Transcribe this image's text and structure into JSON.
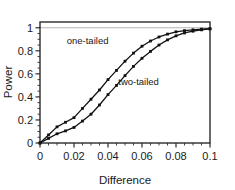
{
  "chart_data": {
    "type": "line",
    "title": "",
    "xlabel": "Difference",
    "ylabel": "Power",
    "xlim": [
      0,
      0.1
    ],
    "ylim": [
      0,
      1.05
    ],
    "grid": false,
    "legend_position": "inline-annotation",
    "reference_line": {
      "axis": "y",
      "value": 1,
      "color": "#b4b4b4"
    },
    "xticks": [
      0,
      0.02,
      0.04,
      0.06,
      0.08,
      0.1
    ],
    "xtick_labels": [
      "0",
      "0.02",
      "0.04",
      "0.06",
      "0.08",
      "0.1"
    ],
    "xminor_step": 0.005,
    "yticks": [
      0,
      0.2,
      0.4,
      0.6,
      0.8,
      1
    ],
    "ytick_labels": [
      "0",
      "0.2",
      "0.4",
      "0.6",
      "0.8",
      "1"
    ],
    "yminor_step": 0.05,
    "x": [
      0,
      0.005,
      0.01,
      0.015,
      0.02,
      0.025,
      0.03,
      0.035,
      0.04,
      0.045,
      0.05,
      0.055,
      0.06,
      0.065,
      0.07,
      0.075,
      0.08,
      0.085,
      0.09,
      0.095,
      0.1
    ],
    "series": [
      {
        "name": "one-tailed",
        "label": "one-tailed",
        "marker": "square",
        "color": "#111111",
        "values": [
          0.0,
          0.07,
          0.14,
          0.18,
          0.22,
          0.3,
          0.38,
          0.46,
          0.55,
          0.63,
          0.71,
          0.78,
          0.84,
          0.885,
          0.92,
          0.945,
          0.965,
          0.975,
          0.982,
          0.988,
          0.992
        ]
      },
      {
        "name": "two-tailed",
        "label": "two-tailed",
        "marker": "square",
        "color": "#111111",
        "values": [
          0.0,
          0.04,
          0.08,
          0.105,
          0.135,
          0.19,
          0.25,
          0.33,
          0.42,
          0.5,
          0.585,
          0.665,
          0.735,
          0.795,
          0.85,
          0.895,
          0.93,
          0.955,
          0.97,
          0.982,
          0.99
        ]
      }
    ],
    "annotations": [
      {
        "text": "one-tailed",
        "x": 0.028,
        "y": 0.86
      },
      {
        "text": "two-tailed",
        "x": 0.058,
        "y": 0.5
      }
    ]
  },
  "figure": {
    "background_color": "#ffffff",
    "frame_color": "#2b2b2b"
  }
}
